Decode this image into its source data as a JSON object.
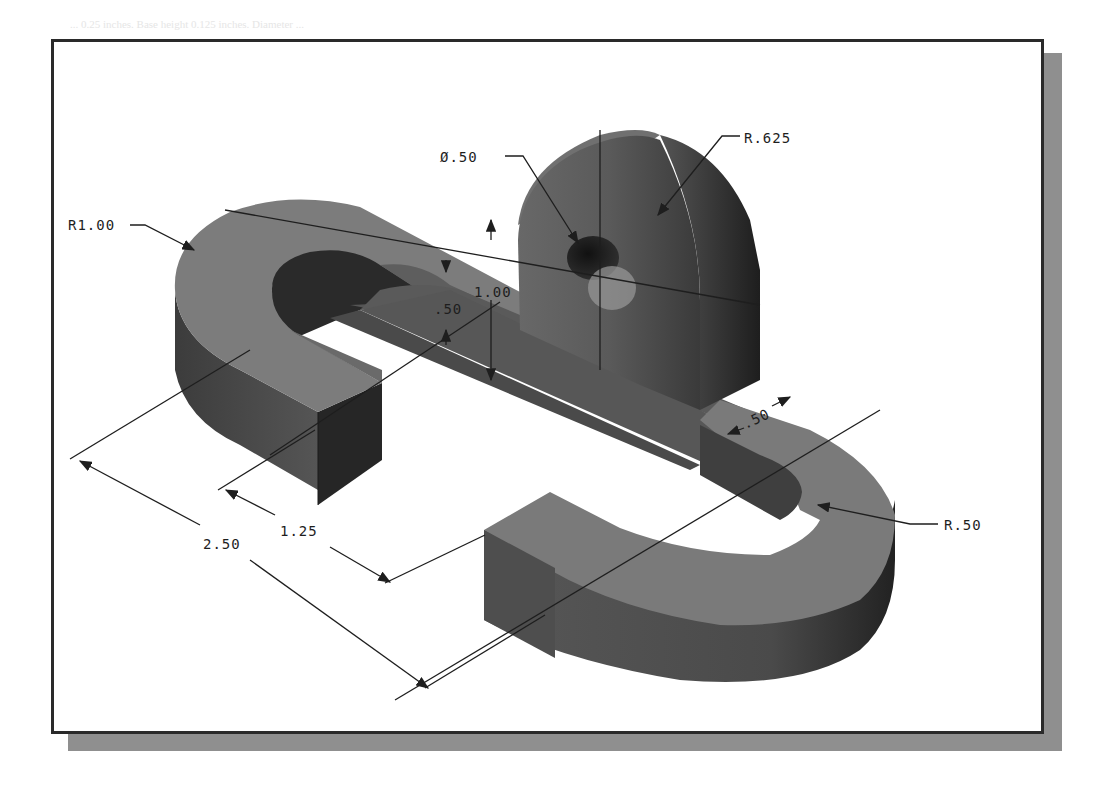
{
  "page": {
    "bleed_through_text": "... 0.25 inches. Base height 0.125 inches. Diameter ..."
  },
  "figure": {
    "type": "isometric-part-drawing",
    "dimensions": {
      "hole_diameter": "Ø.50",
      "boss_radius": "R.625",
      "outer_radius": "R1.00",
      "inner_radius": "R.50",
      "thickness": ".50",
      "boss_height": "1.00",
      "slot_width": ".50",
      "leg_offset": "1.25",
      "overall_offset": "2.50"
    },
    "colors": {
      "frame_border": "#2a2a2a",
      "shadow": "#8f8f8f",
      "top_face": "#7c7c7c",
      "side_face": "#4e4e4e",
      "dark_face": "#262626",
      "dimension_line": "#1e1e1e"
    }
  }
}
